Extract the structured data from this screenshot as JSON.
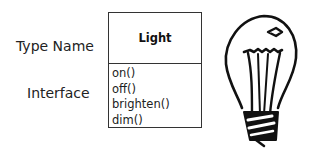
{
  "labels": {
    "type_name": "Type Name",
    "interface": "Interface"
  },
  "class_box": {
    "title": "Light",
    "methods": [
      "on()",
      "off()",
      "brighten()",
      "dim()"
    ]
  },
  "illustration": {
    "icon": "lightbulb-icon"
  }
}
